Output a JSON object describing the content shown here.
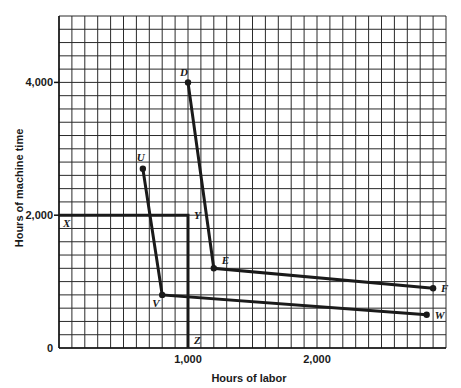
{
  "chart_data": {
    "type": "line",
    "title": "",
    "xlabel": "Hours of labor",
    "ylabel": "Hours of machine time",
    "xlim": [
      0,
      3000
    ],
    "ylim": [
      0,
      5000
    ],
    "grid": true,
    "grid_step": {
      "x": 100,
      "y": 200
    },
    "x_ticks": [
      {
        "value": 1000,
        "label": "1,000"
      },
      {
        "value": 2000,
        "label": "2,000"
      }
    ],
    "y_ticks": [
      {
        "value": 0,
        "label": "0"
      },
      {
        "value": 2000,
        "label": "2,000"
      },
      {
        "value": 4000,
        "label": "4,000"
      }
    ],
    "series": [
      {
        "name": "XYZ",
        "markers": false,
        "points": [
          {
            "label": "X",
            "x": 0,
            "y": 2000
          },
          {
            "label": "Y",
            "x": 1000,
            "y": 2000
          },
          {
            "label": "Z",
            "x": 1000,
            "y": 0
          }
        ]
      },
      {
        "name": "UVW",
        "markers": true,
        "points": [
          {
            "label": "U",
            "x": 650,
            "y": 2700
          },
          {
            "label": "V",
            "x": 800,
            "y": 800
          },
          {
            "label": "W",
            "x": 2850,
            "y": 500
          }
        ]
      },
      {
        "name": "DEF",
        "markers": true,
        "points": [
          {
            "label": "D",
            "x": 1000,
            "y": 4000
          },
          {
            "label": "E",
            "x": 1200,
            "y": 1200
          },
          {
            "label": "F",
            "x": 2900,
            "y": 900
          }
        ]
      }
    ],
    "legend": null
  }
}
